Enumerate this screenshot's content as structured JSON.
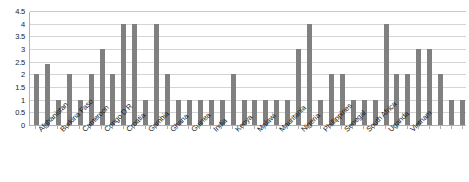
{
  "chart_data": {
    "type": "bar",
    "title": "",
    "subtitle": "",
    "xlabel": "",
    "ylabel": "",
    "ylim": [
      0,
      4.5
    ],
    "ytick_labels": [
      "0",
      "0.5",
      "1",
      "1.5",
      "2",
      "2.5",
      "3",
      "3.5",
      "4",
      "4.5"
    ],
    "ytick_values": [
      0,
      0.5,
      1,
      1.5,
      2,
      2.5,
      3,
      3.5,
      4,
      4.5
    ],
    "grid": true,
    "grid_axis": "y",
    "legend": false,
    "legend_position": "none",
    "bar_color": "#808080",
    "axis_color": "#b0b0b0",
    "grid_color": "#d4d4d4",
    "tick_label_color": "#1a1a1a",
    "xtick_label_rotation": -45,
    "categories": [
      "Afghanistan",
      "",
      "Burkina Faso",
      "",
      "Cameroon",
      "",
      "Congo D R",
      "",
      "Croatia",
      "",
      "Gambia",
      "",
      "Ghana",
      "",
      "Guinea",
      "",
      "India",
      "",
      "Kenya",
      "",
      "Malawi",
      "",
      "Mauritania",
      "",
      "Nigeria",
      "",
      "Phillippines",
      "",
      "Senegal",
      "",
      "South Africa",
      "",
      "Uganda",
      "",
      "Vietnam",
      "",
      "",
      "",
      "",
      ""
    ],
    "visible_xtick_labels": [
      "Afghanistan",
      "Burkina Faso",
      "Cameroon",
      "Congo D R",
      "Croatia",
      "Gambia",
      "Ghana",
      "Guinea",
      "India",
      "Kenya",
      "Malawi",
      "Mauritania",
      "Nigeria",
      "Phillippines",
      "Senegal",
      "South Africa",
      "Uganda",
      "Vietnam"
    ],
    "values": [
      2,
      2.4,
      1,
      2,
      1,
      2,
      3,
      2,
      4,
      4,
      1,
      4,
      2,
      1,
      1,
      1,
      1,
      1,
      2,
      1,
      1,
      1,
      1,
      1,
      3,
      4,
      1,
      2,
      2,
      1,
      1,
      1,
      4,
      2,
      2,
      3,
      3,
      2,
      1,
      1
    ]
  }
}
